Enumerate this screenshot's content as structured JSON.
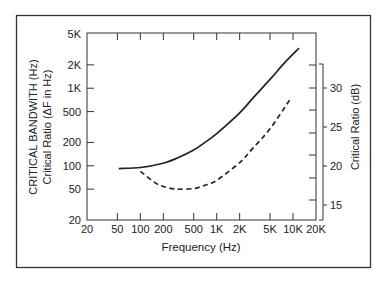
{
  "chart_data": {
    "type": "line",
    "title": "",
    "xlabel": "Frequency (Hz)",
    "ylabel": "CRITICAL BANDWITH (Hz)",
    "ylabel2": "Critical Ratio (ΔF in Hz)",
    "ylabel_right": "Critical Ratio (dB)",
    "xscale": "log",
    "yscale": "log",
    "xlim": [
      20,
      20000
    ],
    "ylim": [
      20,
      5000
    ],
    "ylim_right": [
      13.5,
      33.5
    ],
    "x_ticks": [
      {
        "value": 20,
        "label": "20"
      },
      {
        "value": 50,
        "label": "50"
      },
      {
        "value": 100,
        "label": "100"
      },
      {
        "value": 200,
        "label": "200"
      },
      {
        "value": 500,
        "label": "500"
      },
      {
        "value": 1000,
        "label": "1K"
      },
      {
        "value": 2000,
        "label": "2K"
      },
      {
        "value": 5000,
        "label": "5K"
      },
      {
        "value": 10000,
        "label": "10K"
      },
      {
        "value": 20000,
        "label": "20K"
      }
    ],
    "y_ticks": [
      {
        "value": 20,
        "label": "20"
      },
      {
        "value": 50,
        "label": "50"
      },
      {
        "value": 100,
        "label": "100"
      },
      {
        "value": 200,
        "label": "200"
      },
      {
        "value": 500,
        "label": "500"
      },
      {
        "value": 1000,
        "label": "1K"
      },
      {
        "value": 2000,
        "label": "2K"
      },
      {
        "value": 5000,
        "label": "5K"
      }
    ],
    "y_right_ticks": [
      {
        "value": 15,
        "label": "15"
      },
      {
        "value": 20,
        "label": "20"
      },
      {
        "value": 25,
        "label": "25"
      },
      {
        "value": 30,
        "label": "30"
      }
    ],
    "series": [
      {
        "name": "Critical bandwidth",
        "style": "solid",
        "x": [
          52,
          100,
          200,
          300,
          500,
          700,
          1000,
          2000,
          3000,
          5000,
          8000,
          12000
        ],
        "y": [
          92,
          95,
          108,
          125,
          160,
          200,
          260,
          480,
          750,
          1300,
          2200,
          3300
        ]
      },
      {
        "name": "Critical ratio",
        "style": "dashed",
        "x": [
          100,
          150,
          200,
          300,
          500,
          700,
          1000,
          2000,
          3000,
          5000,
          9000
        ],
        "y": [
          85,
          62,
          54,
          50,
          51,
          56,
          65,
          110,
          170,
          300,
          700
        ]
      }
    ],
    "grid": false,
    "legend": null
  }
}
